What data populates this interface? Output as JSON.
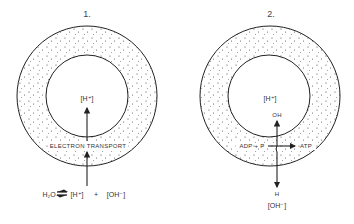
{
  "diagram_1": {
    "number": "1.",
    "inner_label": "[H⁺]",
    "membrane_label": "ELECTRON TRANSPORT",
    "equation": {
      "left": "H₂O",
      "arrow": "⇌",
      "product_1": "[H⁺]",
      "plus": "+",
      "product_2": "[OH⁻]"
    }
  },
  "diagram_2": {
    "number": "2.",
    "inner_label": "[H⁺]",
    "top_label": "OH",
    "reactant_label": "ADP + P",
    "product_label": "ATP",
    "bottom_label_1": "H",
    "bottom_label_2": "[OH⁻]"
  },
  "colors": {
    "line": "#222222",
    "text": "#333333",
    "dots": "#444444"
  }
}
